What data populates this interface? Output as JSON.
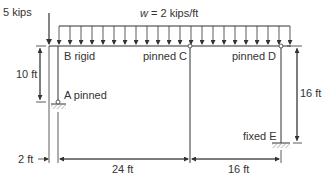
{
  "diagram": {
    "type": "structural-frame",
    "colors": {
      "line": "#333333",
      "hatch": "#999999",
      "background": "#ffffff"
    },
    "loads": {
      "point_load": "5 kips",
      "distributed_load_var": "w",
      "distributed_load_eq": " = 2 kips/ft"
    },
    "joints": {
      "B": "B rigid",
      "C": "pinned C",
      "D": "pinned D",
      "A": "A pinned",
      "E": "fixed E"
    },
    "dimensions": {
      "left_height": "10 ft",
      "right_height": "16 ft",
      "offset": "2 ft",
      "span_1": "24 ft",
      "span_2": "16 ft"
    }
  }
}
